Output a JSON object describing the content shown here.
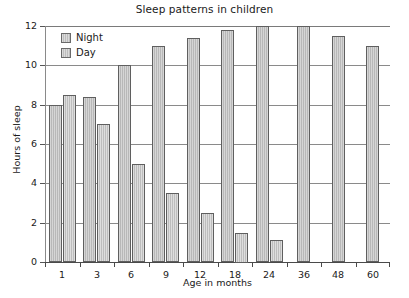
{
  "chart_data": {
    "type": "bar",
    "title": "Sleep patterns in children",
    "xlabel": "Age in months",
    "ylabel": "Hours of sleep",
    "categories": [
      "1",
      "3",
      "6",
      "9",
      "12",
      "18",
      "24",
      "36",
      "48",
      "60"
    ],
    "series": [
      {
        "name": "Night",
        "values": [
          8.0,
          8.4,
          10.0,
          11.0,
          11.4,
          11.8,
          12.0,
          12.0,
          11.5,
          11.0
        ]
      },
      {
        "name": "Day",
        "values": [
          8.5,
          7.0,
          5.0,
          3.5,
          2.5,
          1.5,
          1.1,
          0,
          0,
          0
        ]
      }
    ],
    "ylim": [
      0,
      12
    ],
    "yticks": [
      "0",
      "2",
      "4",
      "6",
      "8",
      "10",
      "12"
    ],
    "ytick_values": [
      0,
      2,
      4,
      6,
      8,
      10,
      12
    ],
    "grid": true,
    "legend_position": "top-left",
    "bar_color": "#bdbdbd",
    "bar_border_color": "#5f5f5f",
    "grid_color": "#8a8a8a",
    "text_color": "#1a1a1a"
  },
  "legend": {
    "entries": [
      {
        "label": "Night"
      },
      {
        "label": "Day"
      }
    ]
  }
}
